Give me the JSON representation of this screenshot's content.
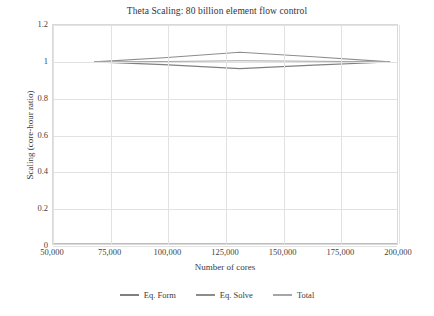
{
  "chart_data": {
    "type": "line",
    "title": "Theta Scaling: 80 billion element flow control",
    "xlabel": "Number of cores",
    "ylabel": "Scaling (core-hour ratio)",
    "xlim": [
      50000,
      200000
    ],
    "ylim": [
      0,
      1.2
    ],
    "xticks": [
      50000,
      75000,
      100000,
      125000,
      150000,
      175000,
      200000
    ],
    "xtick_labels": [
      "50,000",
      "75,000",
      "100,000",
      "125,000",
      "150,000",
      "175,000",
      "200,000"
    ],
    "yticks": [
      0,
      0.2,
      0.4,
      0.6,
      0.8,
      1,
      1.2
    ],
    "ytick_labels": [
      "0",
      "0.2",
      "0.4",
      "0.6",
      "0.8",
      "1",
      "1.2"
    ],
    "grid": true,
    "legend_position": "bottom-center",
    "x": [
      68000,
      98000,
      131000,
      163000,
      196000
    ],
    "series": [
      {
        "name": "Eq. Form",
        "color": "#808080",
        "values": [
          1.0,
          0.985,
          0.963,
          0.982,
          0.999
        ]
      },
      {
        "name": "Eq. Solve",
        "color": "#8c8c8c",
        "values": [
          1.0,
          1.022,
          1.052,
          1.028,
          1.0
        ]
      },
      {
        "name": "Total",
        "color": "#a6a6a6",
        "values": [
          1.0,
          1.002,
          1.006,
          1.003,
          1.0
        ]
      }
    ]
  },
  "legend": {
    "items": [
      {
        "label": "Eq. Form",
        "color": "#808080"
      },
      {
        "label": "Eq. Solve",
        "color": "#8c8c8c"
      },
      {
        "label": "Total",
        "color": "#a6a6a6"
      }
    ]
  }
}
